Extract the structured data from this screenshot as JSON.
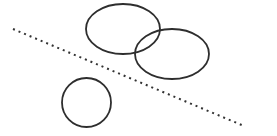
{
  "canvas": {
    "width": 277,
    "height": 136,
    "background": "#ffffff"
  },
  "style": {
    "stroke": "#2e2e2e",
    "stroke_width": 1.8,
    "dot_color": "#333333"
  },
  "shapes": {
    "ellipse_top": {
      "cx": 123,
      "cy": 29,
      "rx": 37,
      "ry": 25
    },
    "ellipse_right": {
      "cx": 172,
      "cy": 54,
      "rx": 37,
      "ry": 25
    },
    "circle_bottom": {
      "cx": 86.5,
      "cy": 102.5,
      "r": 24.5
    },
    "dotted_line": {
      "x1": 13,
      "y1": 29,
      "x2": 244,
      "y2": 126,
      "dash": "2 4"
    }
  }
}
